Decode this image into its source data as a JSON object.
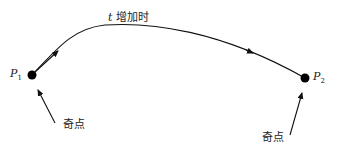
{
  "diagram": {
    "curve_label": {
      "var": "t",
      "text": "增加时"
    },
    "points": [
      {
        "name": "P",
        "sub": "1",
        "annotation": "奇点"
      },
      {
        "name": "P",
        "sub": "2",
        "annotation": "奇点"
      }
    ],
    "colors": {
      "stroke": "#111111",
      "background": "#ffffff"
    }
  }
}
